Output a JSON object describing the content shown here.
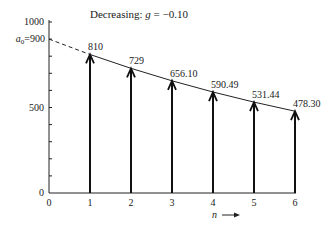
{
  "chart_data": {
    "type": "bar",
    "title": "Decreasing: g = −0.10",
    "title_parts": {
      "prefix": "Decreasing: ",
      "var": "g",
      "rest": " = −0.10"
    },
    "xlabel": "n",
    "ylabel": "",
    "start_label": "a",
    "start_sub": "0",
    "start_value_label": "=900",
    "start_value": 900,
    "x": [
      1,
      2,
      3,
      4,
      5,
      6
    ],
    "values": [
      810,
      729,
      656.1,
      590.49,
      531.44,
      478.3
    ],
    "value_labels": [
      "810",
      "729",
      "656.10",
      "590.49",
      "531.44",
      "478.30"
    ],
    "x_ticks": [
      "0",
      "1",
      "2",
      "3",
      "4",
      "5",
      "6"
    ],
    "y_ticks": [
      "0",
      "500",
      "1000"
    ],
    "ylim": [
      0,
      1000
    ],
    "xlim": [
      0,
      6
    ],
    "growth_rate": -0.1,
    "grid": false,
    "legend": "none"
  }
}
